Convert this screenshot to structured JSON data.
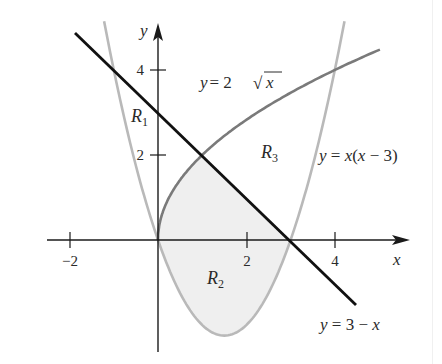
{
  "figure": {
    "axes": {
      "x_label": "x",
      "y_label": "y",
      "x_ticks": [
        {
          "value": -2,
          "label": "−2"
        },
        {
          "value": 2,
          "label": "2"
        },
        {
          "value": 4,
          "label": "4"
        }
      ],
      "y_ticks": [
        {
          "value": 2,
          "label": "2"
        },
        {
          "value": 4,
          "label": "4"
        }
      ]
    },
    "curves": {
      "sqrt": {
        "eq_prefix": "y = 2",
        "radical": "√",
        "radicand": "x",
        "color": "#7a7a7a"
      },
      "parabola": {
        "label": "y = x(x − 3)",
        "color": "#b9b9b9"
      },
      "line": {
        "label": "y = 3 − x",
        "color": "#111111"
      }
    },
    "regions": {
      "r1": {
        "letter": "R",
        "sub": "1"
      },
      "r2": {
        "letter": "R",
        "sub": "2"
      },
      "r3": {
        "letter": "R",
        "sub": "3"
      },
      "shade_color": "#efefef"
    }
  }
}
